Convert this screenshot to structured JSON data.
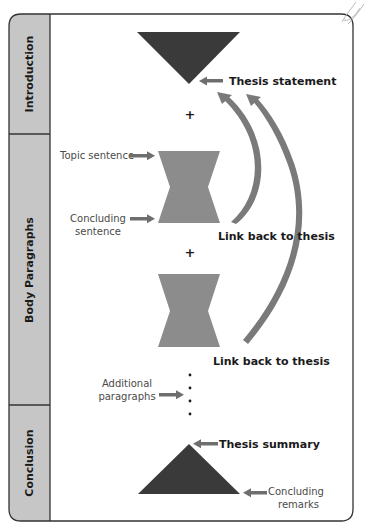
{
  "colors": {
    "frame_stroke": "#333333",
    "sidebar_fill": "#c6c6c6",
    "dark_shape": "#3a3a3a",
    "mid_shape": "#8c8c8c",
    "arrow": "#6e6e6e",
    "background": "#ffffff"
  },
  "sections": [
    {
      "id": "introduction",
      "label": "Introduction"
    },
    {
      "id": "body",
      "label": "Body Paragraphs"
    },
    {
      "id": "conclusion",
      "label": "Conclusion"
    }
  ],
  "introduction": {
    "shape": "inverted-triangle",
    "thesis_label": "Thesis statement"
  },
  "connectors": {
    "plus_1": "+",
    "plus_2": "+",
    "ellipsis_dots": 4
  },
  "body": {
    "paragraph_1": {
      "shape": "hourglass",
      "topic_label": "Topic sentence",
      "concluding_label_line1": "Concluding",
      "concluding_label_line2": "sentence",
      "link_label": "Link back to thesis"
    },
    "paragraph_2": {
      "shape": "hourglass",
      "link_label": "Link back to thesis"
    },
    "additional": {
      "label_line1": "Additional",
      "label_line2": "paragraphs"
    }
  },
  "conclusion": {
    "shape": "triangle",
    "summary_label": "Thesis summary",
    "remarks_line1": "Concluding",
    "remarks_line2": "remarks"
  }
}
